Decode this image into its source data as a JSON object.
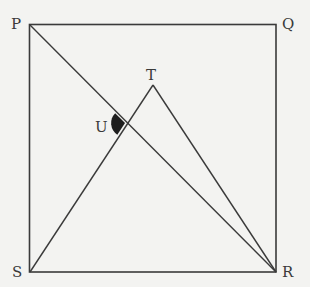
{
  "diagram": {
    "type": "geometry",
    "colors": {
      "background": "#f3f3f1",
      "stroke": "#3a3a3a",
      "angle_fill": "#1e1e1e"
    },
    "points": {
      "P": {
        "label": "P",
        "x": 29,
        "y": 24
      },
      "Q": {
        "label": "Q",
        "x": 276,
        "y": 24
      },
      "R": {
        "label": "R",
        "x": 276,
        "y": 272
      },
      "S": {
        "label": "S",
        "x": 30,
        "y": 272
      },
      "T": {
        "label": "T",
        "x": 153,
        "y": 85
      },
      "U": {
        "label": "U",
        "x": 125,
        "y": 123
      }
    },
    "segments": [
      "PQ",
      "QR",
      "RS",
      "SP",
      "PR",
      "ST",
      "TR"
    ],
    "marked_angle": {
      "vertex": "U",
      "between": [
        "UP",
        "US"
      ],
      "style": "filled"
    }
  }
}
